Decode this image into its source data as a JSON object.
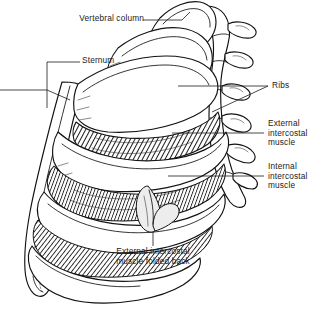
{
  "figure": {
    "background_color": "#ffffff",
    "ink_color": "#121212",
    "label_color": "#1a1a1a",
    "muscle_shade_color": "#3a3a3a",
    "flap_shade_color": "#ededed",
    "width": 334,
    "height": 312
  },
  "labels": {
    "vertebral_column": "Vertebral column",
    "sternum": "Sternum",
    "ribs": "Ribs",
    "external_intercostal": {
      "line1": "External",
      "line2": "intercostal",
      "line3": "muscle"
    },
    "internal_intercostal": {
      "line1": "Internal",
      "line2": "intercostal",
      "line3": "muscle"
    },
    "folded_flap": {
      "line1": "External intercostal",
      "line2": "muscle folded back"
    }
  },
  "structures": [
    {
      "name": "vertebral-column",
      "description": "Thoracic vertebrae stacked vertically at right with transverse processes"
    },
    {
      "name": "sternum",
      "description": "Vertical breastbone band at left, tapering inferiorly to xiphoid process"
    },
    {
      "name": "ribs",
      "description": "Curved ribs arcing from vertebral column to sternum"
    },
    {
      "name": "external-intercostal-muscle",
      "description": "Diagonally hatched muscle sheet between ribs"
    },
    {
      "name": "internal-intercostal-muscle",
      "description": "Deeper hatched muscle layer between ribs"
    },
    {
      "name": "external-intercostal-flap",
      "description": "Triangular flap of external intercostal muscle folded back"
    }
  ]
}
